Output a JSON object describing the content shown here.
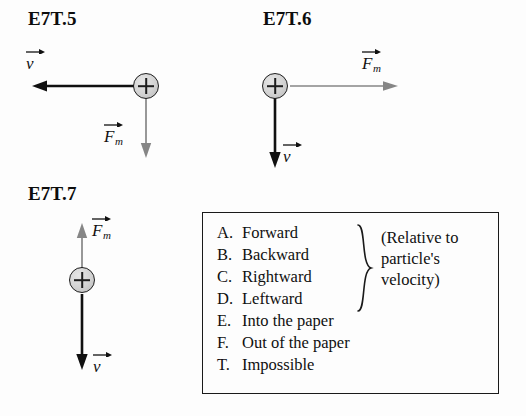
{
  "figure": {
    "background_color": "#fdfdfd",
    "ink_color": "#121212",
    "force_arrow_color": "#808080",
    "velocity_arrow_color": "#101010"
  },
  "problems": [
    {
      "id": "e7t5",
      "label": "E7T.5",
      "particle_charge": "+",
      "velocity": {
        "label_base": "v",
        "direction": "left",
        "arrow_style": "thick-black"
      },
      "force": {
        "label_base": "F",
        "label_sub": "m",
        "direction": "down",
        "arrow_style": "thin-gray"
      }
    },
    {
      "id": "e7t6",
      "label": "E7T.6",
      "particle_charge": "+",
      "velocity": {
        "label_base": "v",
        "direction": "down",
        "arrow_style": "thick-black"
      },
      "force": {
        "label_base": "F",
        "label_sub": "m",
        "direction": "right",
        "arrow_style": "thin-gray"
      }
    },
    {
      "id": "e7t7",
      "label": "E7T.7",
      "particle_charge": "+",
      "velocity": {
        "label_base": "v",
        "direction": "down",
        "arrow_style": "thick-black"
      },
      "force": {
        "label_base": "F",
        "label_sub": "m",
        "direction": "up",
        "arrow_style": "thin-gray"
      }
    }
  ],
  "answer_box": {
    "options": [
      {
        "key": "A.",
        "text": "Forward"
      },
      {
        "key": "B.",
        "text": "Backward"
      },
      {
        "key": "C.",
        "text": "Rightward"
      },
      {
        "key": "D.",
        "text": "Leftward"
      },
      {
        "key": "E.",
        "text": "Into the paper"
      },
      {
        "key": "F.",
        "text": "Out of the paper"
      },
      {
        "key": "T.",
        "text": "Impossible"
      }
    ],
    "note_lines": [
      "(Relative to",
      "particle's",
      "velocity)"
    ]
  }
}
